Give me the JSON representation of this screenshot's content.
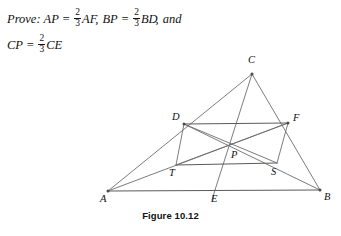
{
  "prove": {
    "lead_label": "Prove:",
    "line1": [
      {
        "kind": "expr",
        "text": "AP"
      },
      {
        "kind": "eq",
        "text": "="
      },
      {
        "kind": "frac",
        "num": "2",
        "den": "3"
      },
      {
        "kind": "expr",
        "text": "AF"
      },
      {
        "kind": "sep",
        "text": ","
      },
      {
        "kind": "expr",
        "text": "BP"
      },
      {
        "kind": "eq",
        "text": "="
      },
      {
        "kind": "frac",
        "num": "2",
        "den": "3"
      },
      {
        "kind": "expr",
        "text": "BD"
      },
      {
        "kind": "sep",
        "text": ","
      },
      {
        "kind": "word",
        "text": "and"
      }
    ],
    "line2": [
      {
        "kind": "expr",
        "text": "CP"
      },
      {
        "kind": "eq",
        "text": "="
      },
      {
        "kind": "frac",
        "num": "2",
        "den": "3"
      },
      {
        "kind": "expr",
        "text": "CE"
      }
    ],
    "full_text": "Prove: AP = 2/3 AF, BP = 2/3 BD, and CP = 2/3 CE"
  },
  "caption": {
    "text": "Figure 10.12"
  },
  "colors": {
    "line": "#6d6d6d",
    "label": "#111111",
    "background": "#ffffff"
  },
  "figure": {
    "points": [
      {
        "id": "A",
        "label": "A",
        "x": 108,
        "y": 143,
        "label_x": 100,
        "label_y": 154,
        "dot": true
      },
      {
        "id": "B",
        "label": "B",
        "x": 320,
        "y": 142,
        "label_x": 324,
        "label_y": 152,
        "dot": true
      },
      {
        "id": "C",
        "label": "C",
        "x": 252,
        "y": 26,
        "label_x": 248,
        "label_y": 15,
        "dot": true
      },
      {
        "id": "D",
        "label": "D",
        "x": 184,
        "y": 76,
        "label_x": 172,
        "label_y": 72,
        "dot": true
      },
      {
        "id": "F",
        "label": "F",
        "x": 288,
        "y": 75,
        "label_x": 293,
        "label_y": 73,
        "dot": true
      },
      {
        "id": "E",
        "label": "E",
        "x": 215,
        "y": 142,
        "label_x": 211,
        "label_y": 154,
        "dot": false
      },
      {
        "id": "P",
        "label": "P",
        "x": 232,
        "y": 97,
        "label_x": 231,
        "label_y": 110,
        "dot": false
      },
      {
        "id": "T",
        "label": "T",
        "x": 176,
        "y": 117,
        "label_x": 169,
        "label_y": 128,
        "dot": false
      },
      {
        "id": "S",
        "label": "S",
        "x": 277,
        "y": 115,
        "label_x": 271,
        "label_y": 127,
        "dot": false
      }
    ],
    "segments": [
      {
        "name": "side-AB",
        "from": "A",
        "to": "B",
        "weight": "heavier"
      },
      {
        "name": "side-AC",
        "from": "A",
        "to": "C",
        "weight": "normal"
      },
      {
        "name": "side-BC",
        "from": "B",
        "to": "C",
        "weight": "normal"
      },
      {
        "name": "median-AF",
        "from": "A",
        "to": "F",
        "weight": "normal"
      },
      {
        "name": "median-BD",
        "from": "B",
        "to": "D",
        "weight": "normal"
      },
      {
        "name": "median-CE",
        "from": "C",
        "to": "E",
        "weight": "normal"
      },
      {
        "name": "midsegment-DF",
        "from": "D",
        "to": "F",
        "weight": "heavier"
      },
      {
        "name": "segment-TS",
        "from": "T",
        "to": "S",
        "weight": "heavier"
      },
      {
        "name": "segment-DT",
        "from": "D",
        "to": "T",
        "weight": "normal"
      },
      {
        "name": "segment-FS",
        "from": "F",
        "to": "S",
        "weight": "normal"
      },
      {
        "name": "diagonal-DS",
        "from": "D",
        "to": "S",
        "weight": "normal"
      },
      {
        "name": "diagonal-TF",
        "from": "T",
        "to": "F",
        "weight": "normal"
      }
    ],
    "extensions": [
      {
        "name": "median-CE-extension",
        "x1": 215,
        "y1": 142,
        "x2": 212,
        "y2": 152
      }
    ]
  }
}
